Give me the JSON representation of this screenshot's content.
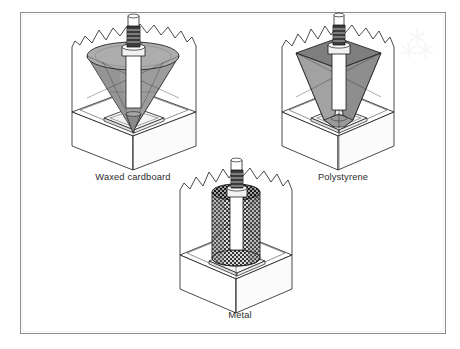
{
  "figure": {
    "background_color": "#ffffff",
    "border_color": "#8c8c92",
    "line_color": "#1d1d1d",
    "panels": [
      {
        "id": "waxed-cardboard",
        "label": "Waxed cardboard",
        "former_shape": "cone",
        "former_fill": "#9a9a9a",
        "former_fill_light": "#b4b4b4",
        "caption_x": 133,
        "caption_y": 177
      },
      {
        "id": "polystyrene",
        "label": "Polystyrene",
        "former_shape": "inverted-pyramid",
        "former_fill": "#8f8f8f",
        "former_fill_light": "#a8a8a8",
        "caption_x": 343,
        "caption_y": 177
      },
      {
        "id": "metal",
        "label": "Metal",
        "former_shape": "mesh-cylinder",
        "former_fill": "#5e5e5e",
        "former_fill_light": "#8a8a8a",
        "caption_x": 240,
        "caption_y": 315
      }
    ],
    "components": {
      "ground_block": "soil-block",
      "base_plate": "base-plate",
      "rod": "threaded-rod",
      "collar": "collar-sleeve"
    },
    "watermark_glyph": "⁂"
  }
}
